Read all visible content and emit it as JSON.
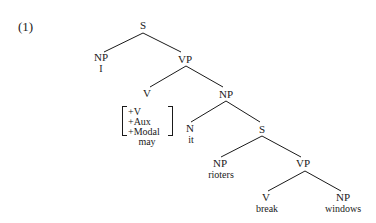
{
  "example_number": "(1)",
  "nodes": {
    "s1": "S",
    "np1": "NP",
    "np1_word": "I",
    "vp1": "VP",
    "v1": "V",
    "features": [
      "+V",
      "+Aux",
      "+Modal"
    ],
    "v1_word": "may",
    "np2": "NP",
    "n1": "N",
    "n1_word": "it",
    "s2": "S",
    "np3": "NP",
    "np3_word": "rioters",
    "vp2": "VP",
    "v2": "V",
    "v2_word": "break",
    "np4": "NP",
    "np4_word": "windows"
  }
}
